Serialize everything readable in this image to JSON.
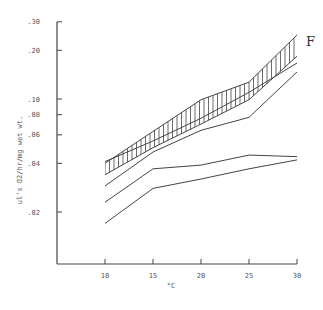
{
  "chart_data": {
    "type": "line",
    "title": "",
    "panel_label": "F",
    "xlabel": "°C",
    "ylabel": "ul's O2/hr/mg wet wt.",
    "yscale": "log",
    "x": [
      10,
      15,
      20,
      25,
      30
    ],
    "x_ticks": [
      "10",
      "15",
      "20",
      "25",
      "30"
    ],
    "y_ticks": [
      {
        "value": 0.3,
        "label": ".30"
      },
      {
        "value": 0.2,
        "label": ".20"
      },
      {
        "value": 0.1,
        "label": ".10"
      },
      {
        "value": 0.08,
        "label": ".08"
      },
      {
        "value": 0.06,
        "label": ".06"
      },
      {
        "value": 0.04,
        "label": ".04"
      },
      {
        "value": 0.02,
        "label": ".02"
      }
    ],
    "ylim": [
      0.011,
      0.3
    ],
    "xlim": [
      5,
      30
    ],
    "grid": false,
    "legend": null,
    "band": {
      "name": "hatched range",
      "upper": [
        0.04,
        0.063,
        0.099,
        0.127,
        0.249
      ],
      "lower": [
        0.034,
        0.05,
        0.07,
        0.099,
        0.184
      ]
    },
    "series": [
      {
        "name": "line C",
        "values": [
          0.041,
          0.055,
          0.076,
          0.11,
          0.167
        ]
      },
      {
        "name": "line D",
        "values": [
          0.029,
          0.047,
          0.064,
          0.077,
          0.147
        ]
      },
      {
        "name": "line A",
        "values": [
          0.023,
          0.037,
          0.039,
          0.045,
          0.044
        ]
      },
      {
        "name": "line B",
        "values": [
          0.017,
          0.028,
          0.032,
          0.037,
          0.042
        ]
      }
    ],
    "colors": {
      "ink": "#444444",
      "background": "#ffffff"
    }
  }
}
